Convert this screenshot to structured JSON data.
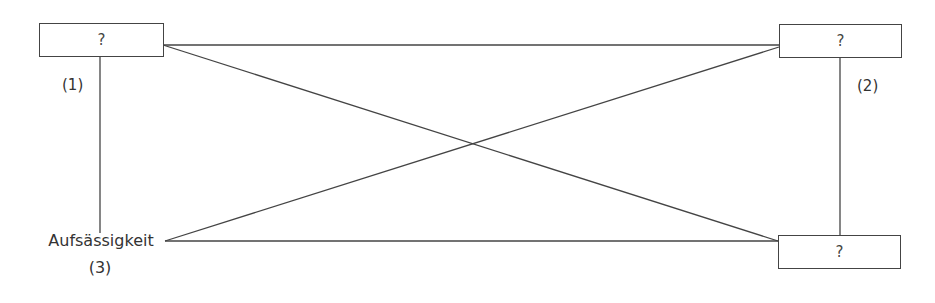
{
  "diagram": {
    "type": "square-of-opposition",
    "nodes": {
      "top_left": {
        "label": "?"
      },
      "top_right": {
        "label": "?"
      },
      "bottom_right": {
        "label": "?"
      },
      "bottom_left": {
        "label": "Aufsässigkeit",
        "number": "(3)"
      }
    },
    "edge_labels": {
      "left": "(1)",
      "right": "(2)"
    },
    "colors": {
      "line": "#444444",
      "text": "#333333",
      "background": "#ffffff"
    }
  }
}
